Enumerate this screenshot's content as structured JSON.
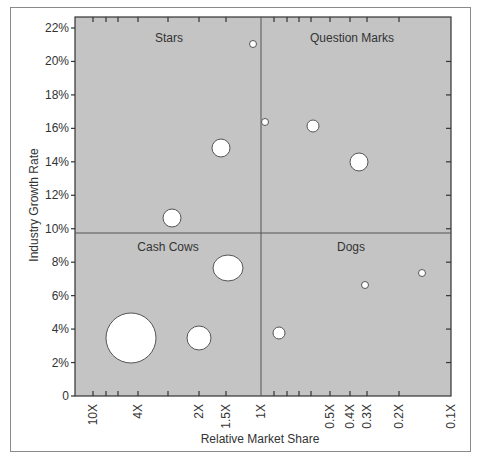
{
  "chart_data": {
    "type": "scatter",
    "subtype": "bubble",
    "title": "",
    "xlabel": "Relative Market Share",
    "ylabel": "Industry Growth Rate",
    "x_scale": "log (reversed)",
    "x_tick_labels": [
      "10X",
      "4X",
      "2X",
      "1.5X",
      "1X",
      "0.5X",
      "0.4X",
      "0.3X",
      "0.2X",
      "0.1X"
    ],
    "y_tick_labels": [
      "0",
      "2%",
      "4%",
      "6%",
      "8%",
      "10%",
      "12%",
      "14%",
      "16%",
      "18%",
      "20%",
      "22%"
    ],
    "ylim": [
      0,
      22
    ],
    "xlim": [
      "10X",
      "0.1X"
    ],
    "grid": false,
    "dividers": {
      "x": "1X",
      "y": "10%"
    },
    "quadrants": [
      {
        "name": "Stars",
        "position": "top-left"
      },
      {
        "name": "Question Marks",
        "position": "top-right"
      },
      {
        "name": "Cash Cows",
        "position": "bottom-left"
      },
      {
        "name": "Dogs",
        "position": "bottom-right"
      }
    ],
    "points": [
      {
        "x": 4.4,
        "y": 3.8,
        "size": "very large",
        "quadrant": "Cash Cows"
      },
      {
        "x": 2.0,
        "y": 3.8,
        "size": "medium",
        "quadrant": "Cash Cows"
      },
      {
        "x": 1.45,
        "y": 7.9,
        "size": "large",
        "quadrant": "Cash Cows"
      },
      {
        "x": 2.7,
        "y": 10.9,
        "size": "small-medium",
        "quadrant": "Stars"
      },
      {
        "x": 1.5,
        "y": 14.9,
        "size": "small-medium",
        "quadrant": "Stars"
      },
      {
        "x": 1.05,
        "y": 21.0,
        "size": "tiny",
        "quadrant": "Stars"
      },
      {
        "x": 0.95,
        "y": 16.5,
        "size": "tiny",
        "quadrant": "Question Marks"
      },
      {
        "x": 0.55,
        "y": 16.2,
        "size": "small",
        "quadrant": "Question Marks"
      },
      {
        "x": 0.33,
        "y": 14.1,
        "size": "small-medium",
        "quadrant": "Question Marks"
      },
      {
        "x": 0.85,
        "y": 4.1,
        "size": "small",
        "quadrant": "Dogs"
      },
      {
        "x": 0.31,
        "y": 6.9,
        "size": "tiny",
        "quadrant": "Dogs"
      },
      {
        "x": 0.15,
        "y": 7.6,
        "size": "tiny",
        "quadrant": "Dogs"
      }
    ],
    "legend": null
  },
  "render": {
    "plot_bg": "#c4c4c4",
    "bubble_fill": "#ffffff",
    "bubble_stroke": "#555555",
    "axis_color": "#333333",
    "bubbles": [
      {
        "cx": 131,
        "cy": 338,
        "rx": 25,
        "ry": 25
      },
      {
        "cx": 199,
        "cy": 338,
        "rx": 12,
        "ry": 12
      },
      {
        "cx": 228,
        "cy": 268,
        "rx": 15,
        "ry": 13
      },
      {
        "cx": 172,
        "cy": 218,
        "rx": 9,
        "ry": 9
      },
      {
        "cx": 221,
        "cy": 148,
        "rx": 9,
        "ry": 9
      },
      {
        "cx": 253,
        "cy": 44,
        "rx": 3.5,
        "ry": 3.5
      },
      {
        "cx": 265,
        "cy": 122,
        "rx": 3.5,
        "ry": 3.5
      },
      {
        "cx": 313,
        "cy": 126,
        "rx": 6,
        "ry": 6
      },
      {
        "cx": 359,
        "cy": 162,
        "rx": 9,
        "ry": 9
      },
      {
        "cx": 279,
        "cy": 333,
        "rx": 6,
        "ry": 6
      },
      {
        "cx": 365,
        "cy": 285,
        "rx": 3.5,
        "ry": 3.5
      },
      {
        "cx": 422,
        "cy": 273,
        "rx": 3.5,
        "ry": 3.5
      }
    ]
  }
}
